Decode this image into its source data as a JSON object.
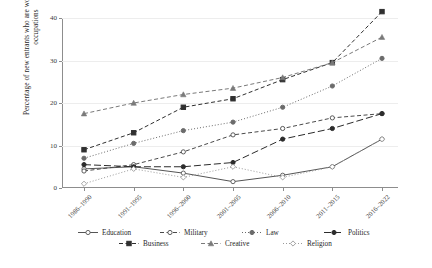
{
  "chart_data": {
    "type": "line",
    "title": "",
    "xlabel": "",
    "ylabel": "Percentage of new entrants who are women within selected occupations",
    "categories": [
      "1986–1990",
      "1991–1995",
      "1996–2000",
      "2001–2005",
      "2006–2010",
      "2011–2015",
      "2016–2022"
    ],
    "ylim": [
      0,
      40
    ],
    "yticks": [
      0,
      10,
      20,
      30,
      40
    ],
    "grid": true,
    "legend_position": "bottom",
    "series": [
      {
        "name": "Education",
        "values": [
          4.5,
          5.0,
          3.5,
          1.5,
          3.0,
          5.0,
          11.5
        ],
        "marker": "circle-open",
        "dash": "solid",
        "color": "#555555"
      },
      {
        "name": "Military",
        "values": [
          4.0,
          5.5,
          8.5,
          12.5,
          14.0,
          16.5,
          17.5
        ],
        "marker": "circle-open",
        "dash": "dashed",
        "color": "#4a4a4a"
      },
      {
        "name": "Law",
        "values": [
          7.0,
          10.5,
          13.5,
          15.5,
          19.0,
          24.0,
          30.5
        ],
        "marker": "circle-filled",
        "dash": "dotted",
        "color": "#6b6b6b"
      },
      {
        "name": "Politics",
        "values": [
          5.5,
          5.0,
          5.0,
          6.0,
          11.5,
          14.0,
          17.5
        ],
        "marker": "circle-filled",
        "dash": "dashed-long",
        "color": "#2c2c2c"
      },
      {
        "name": "Business",
        "values": [
          9.0,
          13.0,
          19.0,
          21.0,
          25.5,
          29.5,
          41.5
        ],
        "marker": "square-filled",
        "dash": "dashed",
        "color": "#303030"
      },
      {
        "name": "Creative",
        "values": [
          17.5,
          20.0,
          22.0,
          23.5,
          26.0,
          29.5,
          35.5
        ],
        "marker": "triangle",
        "dash": "dashed",
        "color": "#7a7a7a"
      },
      {
        "name": "Religion",
        "values": [
          1.0,
          4.5,
          2.5,
          5.0,
          2.5,
          5.0,
          11.5
        ],
        "marker": "diamond-open",
        "dash": "dotted",
        "color": "#9a9a9a"
      }
    ]
  }
}
